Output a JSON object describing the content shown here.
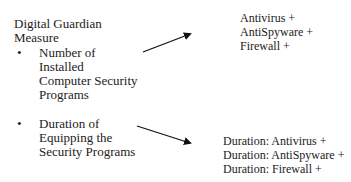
{
  "diagram": {
    "heading": [
      "Digital Guardian",
      "Measure"
    ],
    "items": [
      {
        "bullet": "•",
        "label_lines": [
          "Number of",
          "Installed",
          "Computer Security",
          "Programs"
        ],
        "targets": [
          "Antivirus +",
          "AntiSpyware +",
          "Firewall +"
        ]
      },
      {
        "bullet": "•",
        "label_lines": [
          "Duration of",
          "Equipping the",
          "Security Programs"
        ],
        "targets": [
          "Duration: Antivirus +",
          "Duration: AntiSpyware +",
          "Duration: Firewall +"
        ]
      }
    ],
    "arrow_color": "#111111"
  }
}
